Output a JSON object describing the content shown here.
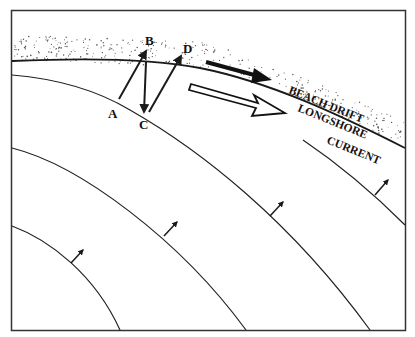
{
  "diagram": {
    "colors": {
      "ink": "#1a1a1a",
      "background": "#ffffff",
      "sand_dots": "#555555"
    },
    "points": [
      {
        "id": "A",
        "label": "A"
      },
      {
        "id": "B",
        "label": "B"
      },
      {
        "id": "C",
        "label": "C"
      },
      {
        "id": "D",
        "label": "D"
      }
    ],
    "labels": {
      "beach_drift": "BEACH DRIFT",
      "longshore_line1": "LONGSHORE",
      "longshore_line2": "CURRENT"
    },
    "features": [
      "shoreline with stippled beach sand",
      "zig-zag swash/backwash path A-B-C-D",
      "solid arrow for beach drift",
      "hollow arrow for longshore current",
      "curved wave crests with propagation arrows"
    ]
  }
}
